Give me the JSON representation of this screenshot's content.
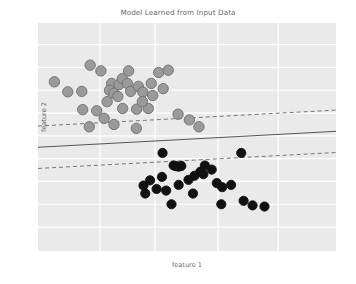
{
  "chart_data": {
    "type": "scatter",
    "title": "Model Learned from Input Data",
    "xlabel": "feature 1",
    "ylabel": "feature 2",
    "xlim": [
      0,
      1
    ],
    "ylim": [
      0,
      1
    ],
    "grid": true,
    "grid_color": "#ffffff",
    "plot_background": "#eaeaea",
    "legend_position": "none",
    "xticks": [],
    "yticks": [],
    "series": [
      {
        "name": "class 0",
        "marker": "circle",
        "color": "#9a9a9a",
        "edge_color": "#6e6e6e",
        "size": 5.2,
        "points": [
          [
            0.055,
            0.742
          ],
          [
            0.175,
            0.815
          ],
          [
            0.1,
            0.698
          ],
          [
            0.147,
            0.7
          ],
          [
            0.211,
            0.79
          ],
          [
            0.247,
            0.735
          ],
          [
            0.24,
            0.705
          ],
          [
            0.255,
            0.692
          ],
          [
            0.268,
            0.678
          ],
          [
            0.197,
            0.615
          ],
          [
            0.222,
            0.582
          ],
          [
            0.272,
            0.73
          ],
          [
            0.283,
            0.756
          ],
          [
            0.3,
            0.735
          ],
          [
            0.311,
            0.7
          ],
          [
            0.304,
            0.79
          ],
          [
            0.337,
            0.722
          ],
          [
            0.352,
            0.697
          ],
          [
            0.331,
            0.622
          ],
          [
            0.37,
            0.625
          ],
          [
            0.385,
            0.682
          ],
          [
            0.405,
            0.783
          ],
          [
            0.437,
            0.793
          ],
          [
            0.42,
            0.712
          ],
          [
            0.47,
            0.6
          ],
          [
            0.508,
            0.575
          ],
          [
            0.54,
            0.545
          ],
          [
            0.15,
            0.62
          ],
          [
            0.172,
            0.545
          ],
          [
            0.33,
            0.538
          ],
          [
            0.284,
            0.625
          ],
          [
            0.232,
            0.655
          ],
          [
            0.38,
            0.735
          ],
          [
            0.255,
            0.555
          ],
          [
            0.35,
            0.655
          ]
        ]
      },
      {
        "name": "class 1",
        "marker": "circle",
        "color": "#111111",
        "edge_color": "#111111",
        "size": 4.6,
        "points": [
          [
            0.418,
            0.43
          ],
          [
            0.455,
            0.375
          ],
          [
            0.463,
            0.372
          ],
          [
            0.472,
            0.37
          ],
          [
            0.481,
            0.373
          ],
          [
            0.416,
            0.325
          ],
          [
            0.376,
            0.31
          ],
          [
            0.354,
            0.287
          ],
          [
            0.398,
            0.272
          ],
          [
            0.43,
            0.265
          ],
          [
            0.36,
            0.252
          ],
          [
            0.448,
            0.205
          ],
          [
            0.505,
            0.312
          ],
          [
            0.525,
            0.33
          ],
          [
            0.545,
            0.348
          ],
          [
            0.555,
            0.337
          ],
          [
            0.56,
            0.375
          ],
          [
            0.583,
            0.357
          ],
          [
            0.6,
            0.298
          ],
          [
            0.618,
            0.28
          ],
          [
            0.615,
            0.205
          ],
          [
            0.648,
            0.29
          ],
          [
            0.682,
            0.43
          ],
          [
            0.69,
            0.22
          ],
          [
            0.72,
            0.2
          ],
          [
            0.76,
            0.195
          ],
          [
            0.472,
            0.29
          ],
          [
            0.52,
            0.252
          ]
        ]
      }
    ],
    "lines": [
      {
        "name": "decision-boundary",
        "style": "solid",
        "color": "#555555",
        "width": 1.0,
        "x": [
          0.0,
          1.0
        ],
        "y": [
          0.455,
          0.525
        ]
      },
      {
        "name": "upper-margin",
        "style": "dashed",
        "color": "#777777",
        "width": 1.0,
        "x": [
          0.0,
          1.0
        ],
        "y": [
          0.548,
          0.618
        ]
      },
      {
        "name": "lower-margin",
        "style": "dashed",
        "color": "#777777",
        "width": 1.0,
        "x": [
          0.0,
          1.0
        ],
        "y": [
          0.362,
          0.432
        ]
      }
    ],
    "gridlines": {
      "vertical_x": [
        0.208,
        0.393,
        0.604,
        0.806
      ],
      "horizontal_y": [
        0.105,
        0.205,
        0.305,
        0.405,
        0.505,
        0.605,
        0.705,
        0.805,
        0.905
      ]
    }
  }
}
